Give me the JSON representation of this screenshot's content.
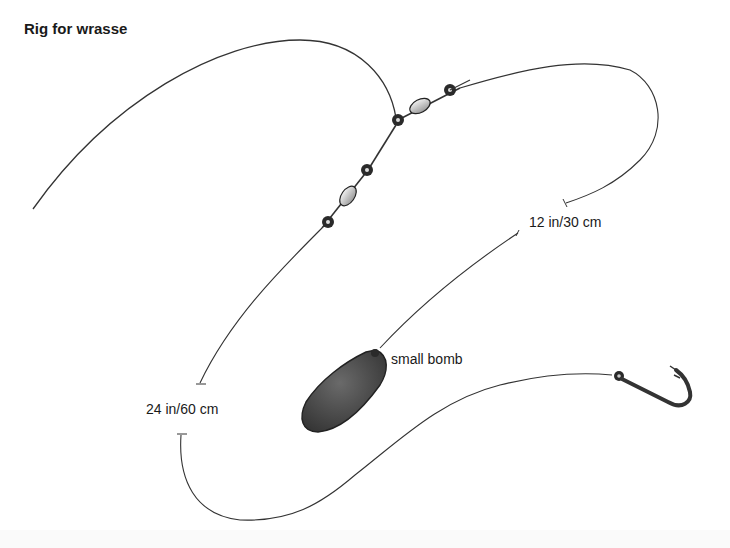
{
  "diagram": {
    "title": "Rig for wrasse",
    "labels": {
      "upper_trace": "12 in/30 cm",
      "lower_trace": "24 in/60 cm",
      "weight": "small bomb"
    },
    "components": [
      {
        "name": "main-line",
        "type": "line"
      },
      {
        "name": "upper-swivel-pair",
        "type": "three-way swivel"
      },
      {
        "name": "lower-swivel-pair",
        "type": "swivel"
      },
      {
        "name": "weight-trace",
        "type": "line",
        "length": "12 in/30 cm"
      },
      {
        "name": "hook-trace",
        "type": "line",
        "length": "24 in/60 cm"
      },
      {
        "name": "small-bomb",
        "type": "weight"
      },
      {
        "name": "hook",
        "type": "hook"
      }
    ],
    "colors": {
      "line": "#333333",
      "swivel": "#2a2a2a",
      "bead": "#c8c8c8",
      "bomb": "#4a4a4a"
    }
  }
}
